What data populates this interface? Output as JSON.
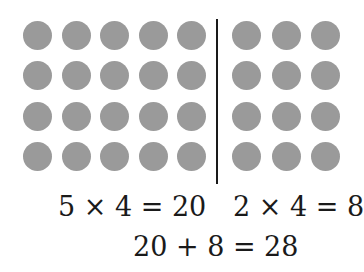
{
  "colors": {
    "dot": "#9a9a9a",
    "text": "#1a1a1a",
    "divider": "#1a1a1a"
  },
  "array": {
    "rows": 4,
    "left_group": {
      "columns": 5,
      "count": 20
    },
    "right_group": {
      "columns": 2,
      "count": 8,
      "visible_columns": 3
    }
  },
  "equations": {
    "left": "5 × 4 = 20",
    "right": "2 × 4 = 8",
    "total": "20 + 8 = 28"
  }
}
